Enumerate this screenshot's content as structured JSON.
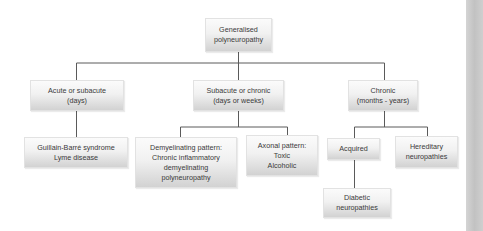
{
  "diagram": {
    "type": "flowchart-tree",
    "root": {
      "id": "root",
      "label": "Generalised\npolyneuropathy"
    },
    "level1": [
      {
        "id": "acute",
        "label": "Acute or subacute\n(days)"
      },
      {
        "id": "subacute",
        "label": "Subacute or chronic\n(days or weeks)"
      },
      {
        "id": "chronic",
        "label": "Chronic\n(months - years)"
      }
    ],
    "level2": [
      {
        "id": "gbs",
        "parent": "acute",
        "label": "Guillain-Barré syndrome\nLyme disease"
      },
      {
        "id": "demyel",
        "parent": "subacute",
        "label": "Demyelinating pattern:\nChronic inflammatory\ndemyelinating\npolyneuropathy"
      },
      {
        "id": "axonal",
        "parent": "subacute",
        "label": "Axonal pattern:\nToxic\nAlcoholic"
      },
      {
        "id": "acquired",
        "parent": "chronic",
        "label": "Acquired"
      },
      {
        "id": "hereditary",
        "parent": "chronic",
        "label": "Hereditary\nneuropathies"
      }
    ],
    "level3": [
      {
        "id": "diabetic",
        "parent": "acquired",
        "label": "Diabetic\nneuropathies"
      }
    ],
    "colors": {
      "line": "#5a5a5a",
      "text": "#3a3a3a",
      "box_top": "#fbfbfb",
      "box_bottom": "#d2d2d2"
    }
  }
}
